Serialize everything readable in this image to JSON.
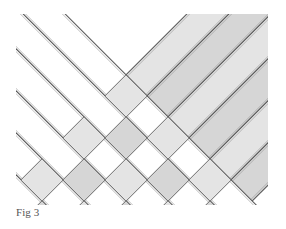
{
  "caption": "Fig 3",
  "figure": {
    "colors": {
      "white_strip": "#ffffff",
      "gray_strip": "#e4e4e4",
      "gray_strip_dark": "#d6d6d6",
      "edge": "#555555",
      "edge_light": "#9a9a9a"
    },
    "clip": {
      "x": 16,
      "y": 14,
      "width": 252,
      "height": 191
    },
    "white_strips": [
      {
        "c": -30
      },
      {
        "c": 12
      },
      {
        "c": 54
      },
      {
        "c": 96
      },
      {
        "c": 138
      },
      {
        "c": 180
      }
    ],
    "gray_strips": [
      {
        "c": 222
      },
      {
        "c": 264
      },
      {
        "c": 306
      },
      {
        "c": 348
      },
      {
        "c": 390
      },
      {
        "c": 432
      }
    ],
    "strip_width": 30
  }
}
